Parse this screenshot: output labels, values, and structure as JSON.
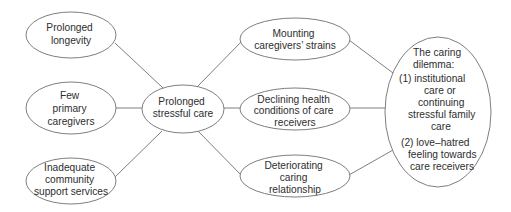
{
  "diagram": {
    "type": "cause-effect concept map",
    "nodes": {
      "longevity": {
        "lines": [
          "Prolonged",
          "longevity"
        ]
      },
      "few_caregivers": {
        "lines": [
          "Few",
          "primary",
          "caregivers"
        ]
      },
      "inadequate_services": {
        "lines": [
          "Inadequate",
          "community",
          "support services"
        ]
      },
      "stressful_care": {
        "lines": [
          "Prolonged",
          "stressful care"
        ]
      },
      "mounting_strains": {
        "lines": [
          "Mounting",
          "caregivers’ strains"
        ]
      },
      "declining_health": {
        "lines": [
          "Declining health",
          "conditions of care",
          "receivers"
        ]
      },
      "deteriorating_relationship": {
        "lines": [
          "Deteriorating",
          "caring",
          "relationship"
        ]
      },
      "caring_dilemma": {
        "lines": [
          "The caring",
          "dilemma:",
          "(1) institutional",
          "care or",
          "continuing",
          "stressful family",
          "care",
          "(2) love–hatred",
          "feeling towards",
          "care receivers"
        ]
      }
    },
    "edges": [
      {
        "from": "longevity",
        "to": "stressful_care"
      },
      {
        "from": "few_caregivers",
        "to": "stressful_care"
      },
      {
        "from": "inadequate_services",
        "to": "stressful_care"
      },
      {
        "from": "stressful_care",
        "to": "mounting_strains"
      },
      {
        "from": "stressful_care",
        "to": "declining_health"
      },
      {
        "from": "stressful_care",
        "to": "deteriorating_relationship"
      },
      {
        "from": "mounting_strains",
        "to": "caring_dilemma"
      },
      {
        "from": "declining_health",
        "to": "caring_dilemma"
      },
      {
        "from": "deteriorating_relationship",
        "to": "caring_dilemma"
      }
    ],
    "colors": {
      "stroke": "#6f6f6f",
      "text": "#2e2e2e",
      "background": "#ffffff"
    }
  }
}
